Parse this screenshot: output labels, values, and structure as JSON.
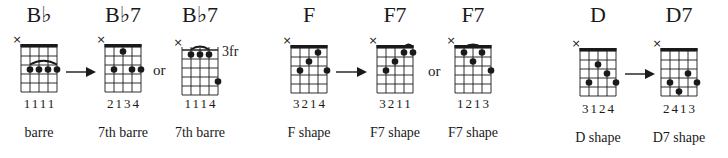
{
  "chart_data": {
    "type": "diagram",
    "groups": [
      {
        "name": "Bb group",
        "chords": [
          {
            "title": "B♭",
            "fingers": "1111",
            "label": "barre",
            "nut": true,
            "fret_label": "",
            "dots": [
              [
                2,
                3
              ],
              [
                3,
                3
              ],
              [
                4,
                3
              ],
              [
                5,
                3
              ]
            ],
            "arc": {
              "from": 2,
              "to": 5,
              "row": 3
            }
          },
          {
            "title": "B♭7",
            "fingers": "2134",
            "label": "7th barre",
            "nut": true,
            "fret_label": "",
            "dots": [
              [
                3,
                1
              ],
              [
                2,
                3
              ],
              [
                4,
                3
              ],
              [
                5,
                3
              ]
            ],
            "arc": null
          },
          {
            "title": "B♭7",
            "fingers": "1114",
            "label": "7th barre",
            "nut": false,
            "fret_label": "3fr",
            "dots": [
              [
                2,
                1
              ],
              [
                3,
                1
              ],
              [
                4,
                1
              ],
              [
                5,
                4
              ]
            ],
            "arc": {
              "from": 2,
              "to": 4,
              "row": 1
            }
          }
        ],
        "connectors": [
          "arrow",
          "or"
        ]
      },
      {
        "name": "F group",
        "chords": [
          {
            "title": "F",
            "fingers": "3214",
            "label": "F shape",
            "nut": true,
            "fret_label": "",
            "dots": [
              [
                4,
                1
              ],
              [
                3,
                2
              ],
              [
                2,
                3
              ],
              [
                5,
                3
              ]
            ],
            "arc": null
          },
          {
            "title": "F7",
            "fingers": "3211",
            "label": "F7 shape",
            "nut": true,
            "fret_label": "",
            "dots": [
              [
                4,
                1
              ],
              [
                5,
                1
              ],
              [
                3,
                2
              ],
              [
                2,
                3
              ]
            ],
            "arc": {
              "from": 4,
              "to": 5,
              "row": 1
            }
          },
          {
            "title": "F7",
            "fingers": "1213",
            "label": "F7 shape",
            "nut": true,
            "fret_label": "",
            "dots": [
              [
                2,
                1
              ],
              [
                4,
                1
              ],
              [
                3,
                2
              ],
              [
                5,
                3
              ]
            ],
            "arc": {
              "from": 2,
              "to": 4,
              "row": 1
            }
          }
        ],
        "connectors": [
          "arrow",
          "or"
        ]
      },
      {
        "name": "D group",
        "chords": [
          {
            "title": "D",
            "fingers": "3124",
            "label": "D shape",
            "nut": true,
            "fret_label": "",
            "dots": [
              [
                3,
                2
              ],
              [
                4,
                3
              ],
              [
                2,
                4
              ],
              [
                5,
                4
              ]
            ],
            "arc": null
          },
          {
            "title": "D7",
            "fingers": "2413",
            "label": "D7 shape",
            "nut": true,
            "fret_label": "",
            "dots": [
              [
                4,
                3
              ],
              [
                2,
                4
              ],
              [
                5,
                4
              ],
              [
                3,
                5
              ]
            ],
            "arc": null
          }
        ],
        "connectors": [
          "arrow"
        ]
      }
    ],
    "muted_marker": "×",
    "strings": 5,
    "connector_text": "or"
  },
  "diagrams": [
    {
      "title": "B♭",
      "fingers": "1111",
      "label": "barre",
      "x": 21,
      "top": 44,
      "nut": true,
      "fret_label": "",
      "dots": [
        [
          2,
          3
        ],
        [
          3,
          3
        ],
        [
          4,
          3
        ],
        [
          5,
          3
        ]
      ],
      "arc": [
        2,
        5,
        3
      ]
    },
    {
      "title": "B♭7",
      "fingers": "2134",
      "label": "7th barre",
      "x": 105,
      "top": 44,
      "nut": true,
      "fret_label": "",
      "dots": [
        [
          3,
          1
        ],
        [
          2,
          3
        ],
        [
          4,
          3
        ],
        [
          5,
          3
        ]
      ],
      "arc": null
    },
    {
      "title": "B♭7",
      "fingers": "1114",
      "label": "7th barre",
      "x": 182,
      "top": 47,
      "nut": false,
      "fret_label": "3fr",
      "dots": [
        [
          2,
          1
        ],
        [
          3,
          1
        ],
        [
          4,
          1
        ],
        [
          5,
          4
        ]
      ],
      "arc": [
        2,
        4,
        1
      ]
    },
    {
      "title": "F",
      "fingers": "3214",
      "label": "F shape",
      "x": 291,
      "top": 45,
      "nut": true,
      "fret_label": "",
      "dots": [
        [
          4,
          1
        ],
        [
          3,
          2
        ],
        [
          2,
          3
        ],
        [
          5,
          3
        ]
      ],
      "arc": null
    },
    {
      "title": "F7",
      "fingers": "3211",
      "label": "F7 shape",
      "x": 377,
      "top": 45,
      "nut": true,
      "fret_label": "",
      "dots": [
        [
          4,
          1
        ],
        [
          5,
          1
        ],
        [
          3,
          2
        ],
        [
          2,
          3
        ]
      ],
      "arc": [
        4,
        5,
        1
      ]
    },
    {
      "title": "F7",
      "fingers": "1213",
      "label": "F7 shape",
      "x": 455,
      "top": 45,
      "nut": true,
      "fret_label": "",
      "dots": [
        [
          2,
          1
        ],
        [
          4,
          1
        ],
        [
          3,
          2
        ],
        [
          5,
          3
        ]
      ],
      "arc": [
        2,
        4,
        1
      ]
    },
    {
      "title": "D",
      "fingers": "3124",
      "label": "D shape",
      "x": 580,
      "top": 48,
      "nut": true,
      "fret_label": "",
      "dots": [
        [
          3,
          2
        ],
        [
          4,
          3
        ],
        [
          2,
          4
        ],
        [
          5,
          4
        ]
      ],
      "arc": null
    },
    {
      "title": "D7",
      "fingers": "2413",
      "label": "D7 shape",
      "x": 661,
      "top": 48,
      "nut": true,
      "fret_label": "",
      "dots": [
        [
          4,
          3
        ],
        [
          2,
          4
        ],
        [
          5,
          4
        ],
        [
          3,
          5
        ]
      ],
      "arc": null
    }
  ],
  "arrows": [
    {
      "x1": 66,
      "x2": 96,
      "y": 72
    },
    {
      "x1": 336,
      "x2": 367,
      "y": 72
    },
    {
      "x1": 625,
      "x2": 655,
      "y": 74
    }
  ],
  "or_labels": [
    {
      "text": "or",
      "x": 153,
      "y": 62
    },
    {
      "text": "or",
      "x": 428,
      "y": 63
    }
  ],
  "muted_marker": "×"
}
